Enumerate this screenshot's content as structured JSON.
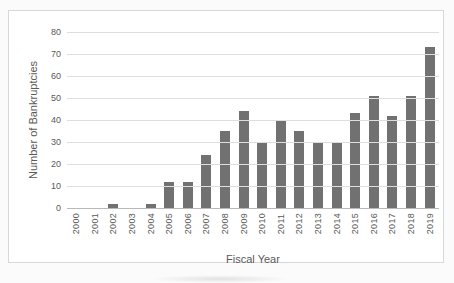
{
  "chart_data": {
    "type": "bar",
    "title": "",
    "categories": [
      "2000",
      "2001",
      "2002",
      "2003",
      "2004",
      "2005",
      "2006",
      "2007",
      "2008",
      "2009",
      "2010",
      "2011",
      "2012",
      "2013",
      "2014",
      "2015",
      "2016",
      "2017",
      "2018",
      "2019"
    ],
    "values": [
      0,
      0,
      2,
      0,
      2,
      12,
      12,
      24,
      35,
      44,
      30,
      40,
      35,
      30,
      30,
      43,
      51,
      42,
      51,
      73
    ],
    "xlabel": "Fiscal Year",
    "ylabel": "Number of Bankruptcies",
    "ylim": [
      0,
      80
    ],
    "yticks": [
      0,
      10,
      20,
      30,
      40,
      50,
      60,
      70,
      80
    ],
    "grid": true,
    "legend": "none",
    "colors": {
      "bar": "#717171",
      "gridline": "#dedede",
      "axis_line": "#b9b9b9",
      "tick_label": "#595959",
      "axis_title": "#595959",
      "frame_border": "#d8d8d8",
      "frame_background": "#ffffff"
    }
  }
}
